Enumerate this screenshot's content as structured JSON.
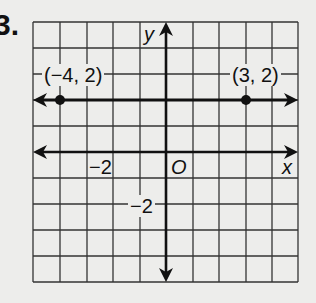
{
  "problem": {
    "number": "3."
  },
  "graph": {
    "axes": {
      "x_label": "x",
      "y_label": "y",
      "origin_label": "O"
    },
    "tick_labels": {
      "x_neg2": "−2",
      "y_neg2": "−2"
    },
    "points": [
      {
        "label": "(−4, 2)",
        "x": -4,
        "y": 2
      },
      {
        "label": "(3, 2)",
        "x": 3,
        "y": 2
      }
    ],
    "line": {
      "equation": "y = 2",
      "arrows": "both"
    },
    "grid": {
      "x_range": [
        -5,
        5
      ],
      "y_range": [
        -5,
        5
      ],
      "unit": 1
    }
  }
}
